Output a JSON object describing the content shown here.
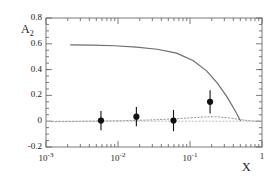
{
  "chart_data": {
    "type": "scatter",
    "title": "",
    "xlabel": "X",
    "ylabel": "A_2",
    "ylabel_base": "A",
    "ylabel_sub": "2",
    "xscale": "log",
    "yscale": "linear",
    "xlim": [
      0.001,
      1.0
    ],
    "ylim": [
      -0.2,
      0.8
    ],
    "grid": false,
    "legend": "none",
    "ytick_labels": [
      "0.8",
      "0.6",
      "0.4",
      "0.2",
      "0",
      "-0.2"
    ],
    "ytick_values": [
      0.8,
      0.6,
      0.4,
      0.2,
      0.0,
      -0.2
    ],
    "xtick_labels": [
      "10^-3",
      "10^-2",
      "10^-1",
      "1"
    ],
    "xtick_mantissas": [
      "10",
      "10",
      "10",
      "1"
    ],
    "xtick_exponents": [
      "-3",
      "-2",
      "-1",
      ""
    ],
    "xtick_values": [
      0.001,
      0.01,
      0.1,
      1.0
    ],
    "series": [
      {
        "name": "data",
        "type": "scatter",
        "marker": "filled-circle",
        "color": "#111111",
        "points": [
          {
            "x": 0.0058,
            "y": 0.005,
            "yerr": 0.075
          },
          {
            "x": 0.018,
            "y": 0.035,
            "yerr": 0.075
          },
          {
            "x": 0.059,
            "y": 0.005,
            "yerr": 0.082
          },
          {
            "x": 0.19,
            "y": 0.15,
            "yerr": 0.09
          }
        ]
      },
      {
        "name": "positivity-bound",
        "type": "line",
        "style": "solid",
        "color": "#6d6d6d",
        "x": [
          0.0022,
          0.0045,
          0.009,
          0.018,
          0.035,
          0.065,
          0.11,
          0.17,
          0.24,
          0.33,
          0.42,
          0.5
        ],
        "y": [
          0.592,
          0.59,
          0.585,
          0.575,
          0.558,
          0.528,
          0.47,
          0.39,
          0.295,
          0.185,
          0.085,
          0.005
        ]
      },
      {
        "name": "theory-dotted",
        "type": "line",
        "style": "dotted",
        "color": "#9a9a9a",
        "x": [
          0.0012,
          0.004,
          0.012,
          0.03,
          0.06,
          0.1,
          0.16,
          0.24,
          0.35,
          0.5,
          0.7,
          1.0
        ],
        "y": [
          -0.004,
          0.0,
          0.004,
          0.01,
          0.018,
          0.026,
          0.033,
          0.034,
          0.026,
          0.012,
          0.002,
          -0.002
        ]
      },
      {
        "name": "zero-line",
        "type": "line",
        "style": "dotted",
        "color": "#b4b4b4",
        "x": [
          0.001,
          1.0
        ],
        "y": [
          0.0,
          0.0
        ]
      }
    ]
  }
}
